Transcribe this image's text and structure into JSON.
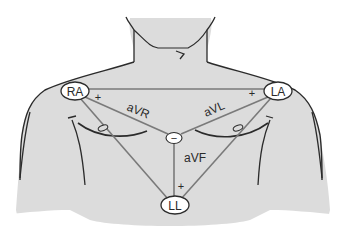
{
  "diagram": {
    "colors": {
      "body_fill": "#dcdcdc",
      "outline": "#2b2b2b",
      "lead_line": "#7a7a7a",
      "electrode_fill": "#ffffff",
      "text": "#2a2a2a"
    },
    "electrodes": {
      "ra": {
        "label": "RA",
        "x": 75,
        "y": 91
      },
      "la": {
        "label": "LA",
        "x": 278,
        "y": 91
      },
      "ll": {
        "label": "LL",
        "x": 175,
        "y": 205
      },
      "center": {
        "label": "−",
        "x": 174,
        "y": 138
      }
    },
    "leads": {
      "avr": {
        "label": "aVR"
      },
      "avl": {
        "label": "aVL"
      },
      "avf": {
        "label": "aVF"
      }
    },
    "polarity": {
      "ra_plus": "+",
      "la_plus": "+",
      "ll_plus": "+"
    }
  }
}
